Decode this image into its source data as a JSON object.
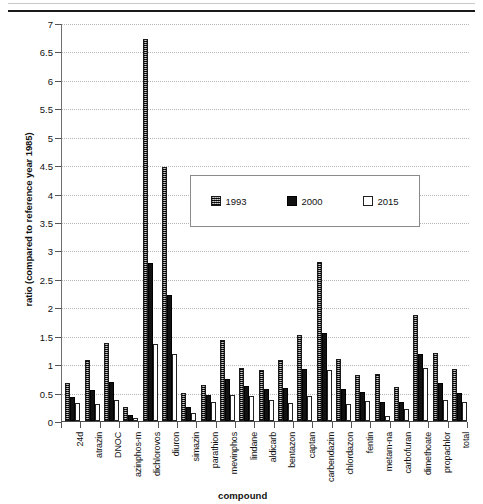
{
  "chart_data": {
    "type": "bar",
    "title": "",
    "xlabel": "compound",
    "ylabel": "ratio (compared to reference year 1985)",
    "ylim": [
      0,
      7
    ],
    "ytick_step": 0.5,
    "yticks": [
      "0",
      "0.5",
      "1",
      "1.5",
      "2",
      "2.5",
      "3",
      "3.5",
      "4",
      "4.5",
      "5",
      "5.5",
      "6",
      "6.5",
      "7"
    ],
    "grid": true,
    "legend_position": "inside upper-right",
    "categories": [
      "24d",
      "atrazin",
      "DNOC",
      "azinphos-m",
      "dichlorovos",
      "diuron",
      "simazin",
      "parathion",
      "mevinphos",
      "lindane",
      "aldicarb",
      "bentazon",
      "captan",
      "carbendazim",
      "chlordazon",
      "fentin",
      "metam-na",
      "carbofuran",
      "dimethoate",
      "propachlor",
      "total"
    ],
    "series": [
      {
        "name": "1993",
        "color": "#4a4a4a",
        "fill": "dotted-hatch",
        "values": [
          0.67,
          1.07,
          1.37,
          0.24,
          6.72,
          4.47,
          0.5,
          0.63,
          1.42,
          0.93,
          0.89,
          1.07,
          1.51,
          2.79,
          1.09,
          0.81,
          0.82,
          0.59,
          1.87,
          1.2,
          0.91
        ]
      },
      {
        "name": "2000",
        "color": "#111111",
        "fill": "solid-black",
        "values": [
          0.42,
          0.55,
          0.69,
          0.11,
          2.78,
          2.22,
          0.25,
          0.46,
          0.74,
          0.61,
          0.56,
          0.58,
          0.91,
          1.55,
          0.57,
          0.51,
          0.34,
          0.34,
          1.18,
          0.67,
          0.5
        ]
      },
      {
        "name": "2015",
        "color": "#ffffff",
        "fill": "empty-white",
        "values": [
          0.31,
          0.3,
          0.37,
          0.05,
          1.35,
          1.18,
          0.14,
          0.34,
          0.45,
          0.44,
          0.37,
          0.32,
          0.44,
          0.9,
          0.3,
          0.36,
          0.08,
          0.21,
          0.94,
          0.37,
          0.34
        ]
      }
    ]
  },
  "legend": {
    "entries": [
      {
        "label": "1993",
        "swatch": "hatched-square-icon"
      },
      {
        "label": "2000",
        "swatch": "filled-square-icon"
      },
      {
        "label": "2015",
        "swatch": "empty-square-icon"
      }
    ]
  }
}
